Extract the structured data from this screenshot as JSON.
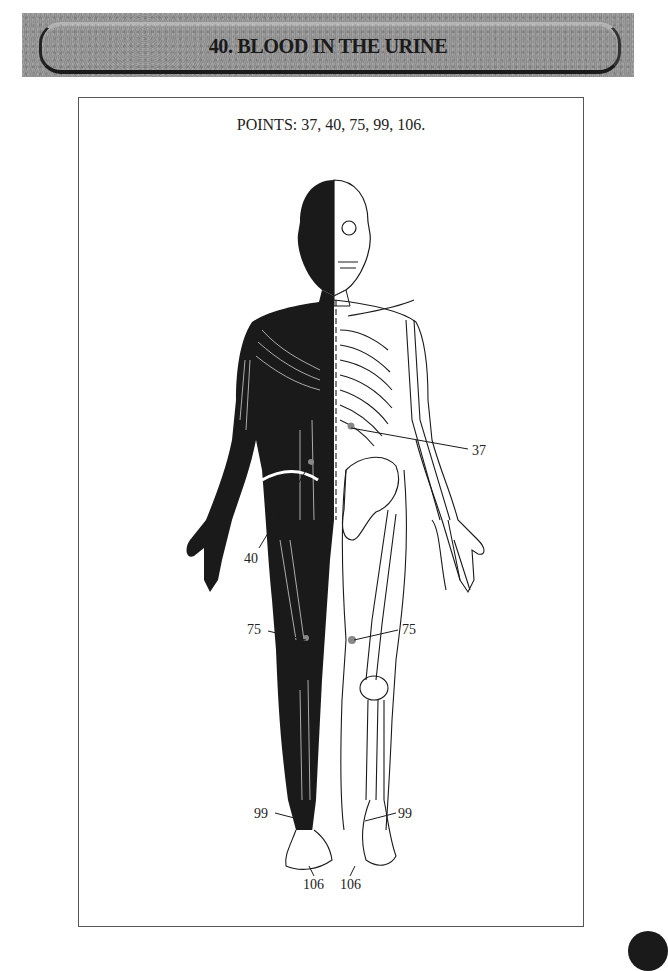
{
  "header": {
    "title": "40.  BLOOD IN THE URINE"
  },
  "figure": {
    "caption": "POINTS: 37, 40, 75, 99, 106.",
    "labels": {
      "p37": "37",
      "p40": "40",
      "p75_left": "75",
      "p75_right": "75",
      "p99_left": "99",
      "p99_right": "99",
      "p106_left": "106",
      "p106_right": "106"
    }
  },
  "colors": {
    "banner_bg": "#939393",
    "ink": "#1a1a1a",
    "point_marker": "#888888"
  }
}
